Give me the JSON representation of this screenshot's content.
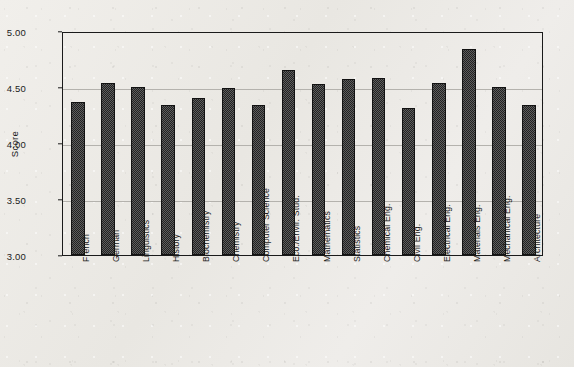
{
  "chart_data": {
    "type": "bar",
    "title": "",
    "subtitle": "",
    "xlabel": "",
    "ylabel": "Score",
    "ylim": [
      3.0,
      5.0
    ],
    "ytick_labels": [
      "5.00",
      "4.50",
      "4.00",
      "3.50",
      "3.00"
    ],
    "ytick_values": [
      5.0,
      4.5,
      4.0,
      3.5,
      3.0
    ],
    "gridlines": [
      4.5,
      4.0,
      3.5
    ],
    "grid": true,
    "legend": null,
    "legend_position": "none",
    "bar_style": {
      "fill_pattern": "checkerboard-dither",
      "fill_color": "#4a4a4a",
      "edge_color": "#121212"
    },
    "categories": [
      "French",
      "German",
      "Linguistics",
      "History",
      "Biochemistry",
      "Chemistry",
      "Computer Science",
      "Eco./Envir. Stud.",
      "Mathematics",
      "Statistics",
      "Chemical Eng.",
      "Civil Eng.",
      "Electrical Eng.",
      "Materials Eng.",
      "Mechanical Eng.",
      "Architecture"
    ],
    "values": [
      4.37,
      4.54,
      4.5,
      4.34,
      4.4,
      4.49,
      4.34,
      4.65,
      4.53,
      4.57,
      4.58,
      4.31,
      4.54,
      4.84,
      4.5,
      4.34
    ]
  }
}
